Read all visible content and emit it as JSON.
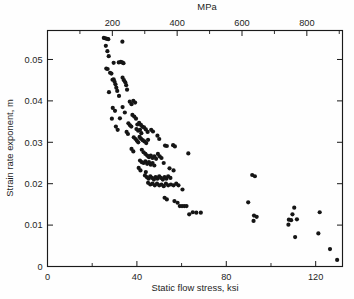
{
  "figure": {
    "bottom_axis_title": "Static flow stress, ksi",
    "left_axis_title": "Strain rate exponent, m",
    "top_axis_title": "MPa"
  },
  "chart_data": {
    "type": "scatter",
    "title": "",
    "xlabel": "Static flow stress, ksi",
    "ylabel": "Strain rate exponent, m",
    "secondary_xlabel": "MPa",
    "xlim": [
      0,
      132
    ],
    "ylim": [
      0,
      0.057
    ],
    "secondary_xlim": [
      0,
      910
    ],
    "grid": false,
    "legend": null,
    "xticks": [
      0,
      20,
      40,
      60,
      80,
      100,
      120
    ],
    "xtick_labels": [
      "0",
      "",
      "40",
      "",
      "80",
      "",
      "120"
    ],
    "yticks": [
      0,
      0.01,
      0.02,
      0.03,
      0.04,
      0.05
    ],
    "ytick_labels": [
      "0",
      "0.01",
      "0.02",
      "0.03",
      "0.04",
      "0.05"
    ],
    "secondary_xticks": [
      100,
      200,
      300,
      400,
      500,
      600,
      700,
      800,
      900
    ],
    "secondary_xtick_labels": [
      "",
      "200",
      "",
      "400",
      "",
      "600",
      "",
      "800",
      ""
    ],
    "marker": "filled-circle",
    "marker_color": "#151515",
    "marker_size": 2.1,
    "n_points": 152,
    "points": [
      [
        25.2,
        0.0552
      ],
      [
        25.9,
        0.0551
      ],
      [
        26.6,
        0.055
      ],
      [
        27.2,
        0.0549
      ],
      [
        26.1,
        0.0533
      ],
      [
        26.8,
        0.052
      ],
      [
        27.4,
        0.0508
      ],
      [
        33.5,
        0.0543
      ],
      [
        26.3,
        0.0478
      ],
      [
        26.9,
        0.0477
      ],
      [
        29.6,
        0.0492
      ],
      [
        31.9,
        0.0493
      ],
      [
        32.8,
        0.0494
      ],
      [
        33.4,
        0.0493
      ],
      [
        34.0,
        0.0491
      ],
      [
        28.0,
        0.0468
      ],
      [
        28.6,
        0.0466
      ],
      [
        29.1,
        0.0451
      ],
      [
        29.6,
        0.0452
      ],
      [
        30.0,
        0.0446
      ],
      [
        30.4,
        0.044
      ],
      [
        30.8,
        0.0432
      ],
      [
        33.6,
        0.0456
      ],
      [
        34.2,
        0.045
      ],
      [
        34.8,
        0.0445
      ],
      [
        35.2,
        0.0438
      ],
      [
        35.6,
        0.0427
      ],
      [
        27.5,
        0.0421
      ],
      [
        31.2,
        0.0424
      ],
      [
        32.0,
        0.0412
      ],
      [
        36.8,
        0.0398
      ],
      [
        37.6,
        0.0392
      ],
      [
        38.4,
        0.04
      ],
      [
        39.2,
        0.0396
      ],
      [
        29.2,
        0.0383
      ],
      [
        30.2,
        0.0376
      ],
      [
        33.6,
        0.0385
      ],
      [
        34.6,
        0.0372
      ],
      [
        38.0,
        0.0366
      ],
      [
        38.8,
        0.0362
      ],
      [
        39.6,
        0.0357
      ],
      [
        28.8,
        0.0357
      ],
      [
        32.4,
        0.0358
      ],
      [
        36.2,
        0.0346
      ],
      [
        36.9,
        0.0341
      ],
      [
        37.5,
        0.0338
      ],
      [
        40.2,
        0.0343
      ],
      [
        41.0,
        0.0347
      ],
      [
        41.8,
        0.0342
      ],
      [
        42.4,
        0.0338
      ],
      [
        30.6,
        0.0338
      ],
      [
        31.4,
        0.033
      ],
      [
        35.4,
        0.0325
      ],
      [
        36.0,
        0.032
      ],
      [
        39.8,
        0.0332
      ],
      [
        40.6,
        0.0328
      ],
      [
        41.4,
        0.033
      ],
      [
        42.0,
        0.0322
      ],
      [
        43.2,
        0.0336
      ],
      [
        44.0,
        0.0331
      ],
      [
        44.8,
        0.0325
      ],
      [
        46.4,
        0.033
      ],
      [
        47.2,
        0.0326
      ],
      [
        38.6,
        0.0312
      ],
      [
        39.4,
        0.0308
      ],
      [
        40.0,
        0.0304
      ],
      [
        40.6,
        0.03
      ],
      [
        41.2,
        0.0313
      ],
      [
        41.8,
        0.0309
      ],
      [
        42.6,
        0.0305
      ],
      [
        43.4,
        0.0302
      ],
      [
        44.2,
        0.0298
      ],
      [
        45.0,
        0.0306
      ],
      [
        49.2,
        0.0316
      ],
      [
        50.0,
        0.0308
      ],
      [
        52.6,
        0.0292
      ],
      [
        53.4,
        0.0291
      ],
      [
        56.2,
        0.0293
      ],
      [
        57.0,
        0.029
      ],
      [
        37.6,
        0.0284
      ],
      [
        38.4,
        0.0278
      ],
      [
        42.2,
        0.0282
      ],
      [
        43.0,
        0.0276
      ],
      [
        43.8,
        0.0272
      ],
      [
        44.6,
        0.0268
      ],
      [
        45.4,
        0.0264
      ],
      [
        46.2,
        0.0268
      ],
      [
        47.0,
        0.0262
      ],
      [
        47.8,
        0.0266
      ],
      [
        48.6,
        0.026
      ],
      [
        49.4,
        0.0272
      ],
      [
        50.2,
        0.0266
      ],
      [
        51.0,
        0.0262
      ],
      [
        63.0,
        0.0273
      ],
      [
        41.4,
        0.0256
      ],
      [
        42.2,
        0.0252
      ],
      [
        43.0,
        0.025
      ],
      [
        43.8,
        0.0254
      ],
      [
        44.6,
        0.0248
      ],
      [
        45.4,
        0.0252
      ],
      [
        46.2,
        0.0246
      ],
      [
        47.0,
        0.025
      ],
      [
        47.8,
        0.0244
      ],
      [
        52.0,
        0.025
      ],
      [
        54.6,
        0.0237
      ],
      [
        40.8,
        0.0238
      ],
      [
        41.6,
        0.0232
      ],
      [
        44.0,
        0.0228
      ],
      [
        56.4,
        0.0232
      ],
      [
        43.6,
        0.022
      ],
      [
        44.4,
        0.0216
      ],
      [
        45.2,
        0.0212
      ],
      [
        46.0,
        0.0218
      ],
      [
        46.8,
        0.0214
      ],
      [
        47.6,
        0.021
      ],
      [
        48.4,
        0.0216
      ],
      [
        49.2,
        0.0212
      ],
      [
        50.0,
        0.0218
      ],
      [
        50.8,
        0.0214
      ],
      [
        51.6,
        0.021
      ],
      [
        52.4,
        0.0216
      ],
      [
        53.2,
        0.0212
      ],
      [
        54.0,
        0.0218
      ],
      [
        55.0,
        0.0214
      ],
      [
        91.6,
        0.0221
      ],
      [
        92.8,
        0.0218
      ],
      [
        45.0,
        0.0202
      ],
      [
        46.0,
        0.0198
      ],
      [
        47.0,
        0.02
      ],
      [
        48.0,
        0.0196
      ],
      [
        49.0,
        0.02
      ],
      [
        50.0,
        0.0196
      ],
      [
        51.0,
        0.0198
      ],
      [
        52.0,
        0.0194
      ],
      [
        53.0,
        0.02
      ],
      [
        54.0,
        0.0196
      ],
      [
        55.2,
        0.0198
      ],
      [
        56.4,
        0.0196
      ],
      [
        57.6,
        0.02
      ],
      [
        58.6,
        0.0196
      ],
      [
        60.4,
        0.0186
      ],
      [
        52.4,
        0.0166
      ],
      [
        53.4,
        0.0162
      ],
      [
        56.8,
        0.0158
      ],
      [
        58.2,
        0.0154
      ],
      [
        59.2,
        0.0146
      ],
      [
        60.2,
        0.0146
      ],
      [
        61.2,
        0.0146
      ],
      [
        62.2,
        0.0146
      ],
      [
        89.8,
        0.0155
      ],
      [
        110.4,
        0.0142
      ],
      [
        121.8,
        0.0131
      ],
      [
        109.6,
        0.0126
      ],
      [
        92.4,
        0.0123
      ],
      [
        93.6,
        0.012
      ],
      [
        108.0,
        0.0113
      ],
      [
        109.0,
        0.0112
      ],
      [
        111.6,
        0.0114
      ],
      [
        63.4,
        0.0126
      ],
      [
        65.0,
        0.0131
      ],
      [
        66.6,
        0.013
      ],
      [
        68.6,
        0.013
      ],
      [
        92.2,
        0.011
      ],
      [
        107.8,
        0.0101
      ],
      [
        110.8,
        0.0071
      ],
      [
        121.2,
        0.008
      ],
      [
        126.4,
        0.0042
      ],
      [
        129.6,
        0.0016
      ]
    ]
  }
}
